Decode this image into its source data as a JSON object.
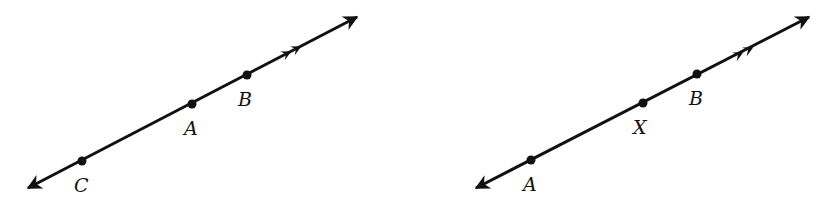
{
  "figures": [
    {
      "name": "figure-left",
      "line": {
        "x1": 28,
        "y1": 188,
        "x2": 357,
        "y2": 17
      },
      "ray_marks": [
        {
          "x": 286,
          "y": 54
        },
        {
          "x": 296,
          "y": 49
        }
      ],
      "points": [
        {
          "label": "C",
          "x": 82,
          "y": 161,
          "lx": 74,
          "ly": 192
        },
        {
          "label": "A",
          "x": 192,
          "y": 104,
          "lx": 184,
          "ly": 135
        },
        {
          "label": "B",
          "x": 247,
          "y": 75,
          "lx": 238,
          "ly": 106
        }
      ]
    },
    {
      "name": "figure-right",
      "line": {
        "x1": 476,
        "y1": 188,
        "x2": 809,
        "y2": 17
      },
      "ray_marks": [
        {
          "x": 738,
          "y": 55
        },
        {
          "x": 748,
          "y": 50
        }
      ],
      "points": [
        {
          "label": "A",
          "x": 531,
          "y": 160,
          "lx": 523,
          "ly": 191
        },
        {
          "label": "X",
          "x": 643,
          "y": 103,
          "lx": 633,
          "ly": 134
        },
        {
          "label": "B",
          "x": 697,
          "y": 74,
          "lx": 689,
          "ly": 105
        }
      ]
    }
  ],
  "colors": {
    "ink": "#111111",
    "background": "#ffffff"
  }
}
